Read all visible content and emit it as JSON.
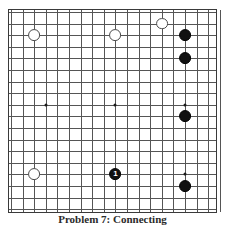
{
  "figure": {
    "kind": "go-board-problem-diagram",
    "caption": "Problem 7: Connecting"
  },
  "board": {
    "columns": 18,
    "rows": 17,
    "cell_px": 11.6,
    "origin_x_px": 10,
    "origin_y_px": 11,
    "line_color": "#555555",
    "border_color": "#3a3a3a",
    "background_color": "#ffffff",
    "star_points": [
      {
        "col": 3,
        "row": 8
      },
      {
        "col": 9,
        "row": 8
      },
      {
        "col": 15,
        "row": 8
      },
      {
        "col": 15,
        "row": 14
      }
    ]
  },
  "stones": [
    {
      "id": "w1",
      "color": "white",
      "col": 2,
      "row": 2,
      "label": ""
    },
    {
      "id": "w2",
      "color": "white",
      "col": 9,
      "row": 2,
      "label": ""
    },
    {
      "id": "w3",
      "color": "white",
      "col": 13,
      "row": 1,
      "label": ""
    },
    {
      "id": "w4",
      "color": "white",
      "col": 2,
      "row": 14,
      "label": ""
    },
    {
      "id": "b1",
      "color": "black",
      "col": 15,
      "row": 2,
      "label": ""
    },
    {
      "id": "b2",
      "color": "black",
      "col": 15,
      "row": 4,
      "label": ""
    },
    {
      "id": "b3",
      "color": "black",
      "col": 15,
      "row": 9,
      "label": ""
    },
    {
      "id": "b4",
      "color": "black",
      "col": 15,
      "row": 15,
      "label": ""
    },
    {
      "id": "b5",
      "color": "black",
      "col": 9,
      "row": 14,
      "label": "1"
    }
  ],
  "colors": {
    "black_stone": "#111111",
    "white_stone": "#ffffff",
    "white_stone_outline": "#4a4a4a",
    "grid": "#555555",
    "caption_text": "#2b2b2b"
  }
}
